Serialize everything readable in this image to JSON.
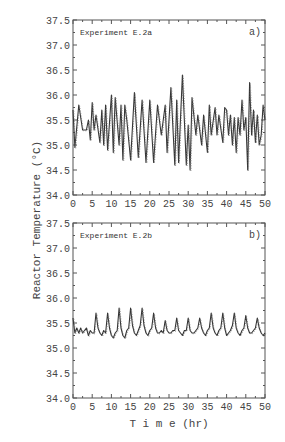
{
  "chart_data": [
    {
      "type": "line",
      "panel_label": "a)",
      "title": "Experiment E.2a",
      "xlabel": "T i m e (hr)",
      "ylabel": "Reactor Temperature (°C)",
      "xlim": [
        0,
        50
      ],
      "ylim": [
        34.0,
        37.5
      ],
      "xticks": [
        "0",
        "5",
        "10",
        "15",
        "20",
        "25",
        "30",
        "35",
        "40",
        "45",
        "50"
      ],
      "yticks": [
        "34.0",
        "34.5",
        "35.0",
        "35.5",
        "36.0",
        "36.5",
        "37.0",
        "37.5"
      ],
      "grid": false,
      "series": [
        {
          "name": "Experiment E.2a",
          "x": [
            0,
            0.5,
            1.5,
            2.5,
            3.5,
            4,
            4.5,
            5,
            5.5,
            6,
            7,
            7.5,
            8,
            8.5,
            9,
            10,
            10.5,
            11,
            12,
            12.5,
            13,
            13.5,
            14,
            15,
            16,
            17,
            18,
            19,
            20,
            21,
            22,
            23,
            24,
            24.5,
            25.5,
            26.5,
            27,
            27.5,
            28.5,
            29.5,
            30,
            30.5,
            31,
            32,
            32.5,
            33.5,
            34,
            35,
            35.5,
            36,
            37,
            37.5,
            38,
            39,
            39.5,
            40,
            40.5,
            41,
            41.5,
            42,
            42.5,
            43,
            43.5,
            44,
            44.5,
            45,
            45.5,
            46,
            46.5,
            47,
            47.5,
            48,
            48.5,
            49,
            49.5,
            50
          ],
          "y": [
            35.7,
            34.95,
            35.8,
            35.3,
            35.3,
            35.5,
            35.1,
            35.85,
            35.3,
            35.6,
            35.05,
            35.7,
            35.0,
            35.8,
            34.9,
            36.0,
            34.85,
            35.95,
            35.0,
            35.8,
            34.7,
            35.8,
            35.5,
            34.7,
            36.05,
            34.75,
            35.9,
            34.65,
            35.9,
            34.65,
            35.8,
            35.2,
            35.8,
            34.85,
            36.15,
            34.6,
            35.9,
            34.65,
            36.4,
            34.6,
            35.4,
            34.5,
            35.95,
            35.2,
            35.6,
            35.0,
            35.6,
            34.85,
            35.8,
            35.2,
            35.75,
            35.2,
            35.6,
            35.05,
            35.75,
            35.7,
            35.2,
            35.6,
            35.0,
            35.55,
            34.85,
            35.55,
            35.2,
            35.9,
            35.3,
            35.55,
            34.5,
            36.25,
            35.2,
            35.7,
            35.05,
            35.6,
            35.0,
            35.2,
            35.8,
            35.5
          ]
        }
      ]
    },
    {
      "type": "line",
      "panel_label": "b)",
      "title": "Experiment E.2b",
      "xlabel": "T i m e (hr)",
      "ylabel": "Reactor Temperature (°C)",
      "xlim": [
        0,
        50
      ],
      "ylim": [
        34.0,
        37.5
      ],
      "xticks": [
        "0",
        "5",
        "10",
        "15",
        "20",
        "25",
        "30",
        "35",
        "40",
        "45",
        "50"
      ],
      "yticks": [
        "34.0",
        "34.5",
        "35.0",
        "35.5",
        "36.0",
        "36.5",
        "37.0",
        "37.5"
      ],
      "grid": false,
      "series": [
        {
          "name": "Experiment E.2b",
          "x": [
            0,
            0.5,
            1,
            1.5,
            2,
            2.5,
            3,
            3.5,
            4,
            4.5,
            5,
            5.5,
            6,
            6.5,
            7,
            7.5,
            8,
            8.5,
            9,
            9.5,
            10,
            10.5,
            11,
            11.5,
            12,
            12.5,
            13,
            13.5,
            14,
            14.5,
            15,
            15.5,
            16,
            16.5,
            17,
            17.5,
            18,
            18.5,
            19,
            19.5,
            20,
            20.5,
            21,
            21.5,
            22,
            22.5,
            23,
            23.5,
            24,
            24.5,
            25,
            25.5,
            26,
            26.5,
            27,
            27.5,
            28,
            28.5,
            29,
            29.5,
            30,
            30.5,
            31,
            31.5,
            32,
            32.5,
            33,
            33.5,
            34,
            34.5,
            35,
            35.5,
            36,
            36.5,
            37,
            37.5,
            38,
            38.5,
            39,
            39.5,
            40,
            40.5,
            41,
            41.5,
            42,
            42.5,
            43,
            43.5,
            44,
            44.5,
            45,
            45.5,
            46,
            46.5,
            47,
            47.5,
            48,
            48.5,
            49,
            49.5,
            50
          ],
          "y": [
            35.6,
            35.3,
            35.4,
            35.3,
            35.4,
            35.3,
            35.35,
            35.4,
            35.25,
            35.35,
            35.3,
            35.3,
            35.7,
            35.4,
            35.3,
            35.25,
            35.35,
            35.3,
            35.7,
            35.4,
            35.25,
            35.2,
            35.3,
            35.35,
            35.8,
            35.4,
            35.25,
            35.2,
            35.35,
            35.4,
            35.8,
            35.45,
            35.3,
            35.25,
            35.35,
            35.45,
            35.8,
            35.45,
            35.3,
            35.25,
            35.35,
            35.4,
            35.7,
            35.4,
            35.3,
            35.3,
            35.35,
            35.3,
            35.55,
            35.35,
            35.3,
            35.3,
            35.35,
            35.35,
            35.6,
            35.35,
            35.3,
            35.25,
            35.35,
            35.35,
            35.6,
            35.35,
            35.3,
            35.3,
            35.35,
            35.4,
            35.6,
            35.4,
            35.3,
            35.25,
            35.35,
            35.4,
            35.7,
            35.4,
            35.3,
            35.25,
            35.35,
            35.4,
            35.7,
            35.4,
            35.25,
            35.3,
            35.35,
            35.45,
            35.7,
            35.4,
            35.3,
            35.25,
            35.35,
            35.4,
            35.65,
            35.4,
            35.3,
            35.3,
            35.35,
            35.4,
            35.6,
            35.4,
            35.3,
            35.25,
            35.3
          ]
        }
      ]
    }
  ],
  "figure": {
    "ylabel": "Reactor Temperature (°C)",
    "xlabel": "T i m e (hr)"
  }
}
